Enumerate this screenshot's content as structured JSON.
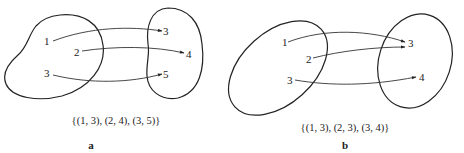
{
  "panels": [
    {
      "id": "a",
      "label": "a",
      "domain_elements": [
        "1",
        "2",
        "3"
      ],
      "codomain_elements": [
        "3",
        "4",
        "5"
      ],
      "mappings": [
        {
          "from": "1",
          "to": "3"
        },
        {
          "from": "2",
          "to": "4"
        },
        {
          "from": "3",
          "to": "5"
        }
      ],
      "set_notation": "{(1, 3), (2, 4), (3, 5)}"
    },
    {
      "id": "b",
      "label": "b",
      "domain_elements": [
        "1",
        "2",
        "3"
      ],
      "codomain_elements": [
        "3",
        "4"
      ],
      "mappings": [
        {
          "from": "1",
          "to": "3"
        },
        {
          "from": "2",
          "to": "3"
        },
        {
          "from": "3",
          "to": "4"
        }
      ],
      "set_notation": "{(1, 3), (2, 3), (3, 4)}"
    }
  ]
}
